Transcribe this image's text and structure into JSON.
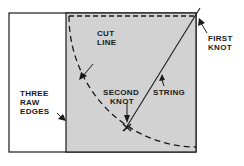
{
  "diagram": {
    "colors": {
      "background": "#ffffff",
      "fabric_fill": "#d2d2d2",
      "line": "#1a1a1a"
    },
    "labels": {
      "cut_line": [
        "CUT",
        "LINE"
      ],
      "first_knot": [
        "FIRST",
        "KNOT"
      ],
      "second_knot": [
        "SECOND",
        "KNOT"
      ],
      "string": "STRING",
      "three_raw_edges": [
        "THREE",
        "RAW",
        "EDGES"
      ]
    }
  }
}
